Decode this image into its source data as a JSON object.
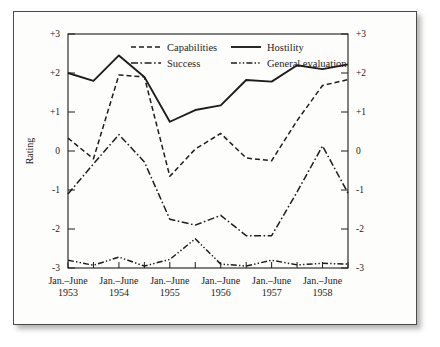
{
  "figure": {
    "background_color": "#fdfdfb",
    "ink_color": "#1d1d1d",
    "border_color": "#4a4a46"
  },
  "chart_data": {
    "type": "line",
    "title": "",
    "xlabel": "",
    "ylabel": "Rating",
    "ylim": [
      -3,
      3
    ],
    "yticks": [
      3,
      2,
      1,
      0,
      -1,
      -2,
      -3
    ],
    "ytick_labels_left": [
      "+3",
      "+2",
      "+1",
      "0",
      "-1",
      "-2",
      "-3"
    ],
    "ytick_labels_right": [
      "+3",
      "+2",
      "+1",
      "0",
      "-1",
      "-2",
      "-3"
    ],
    "grid": false,
    "legend_position": "top-center",
    "x": [
      1,
      2,
      3,
      4,
      5,
      6,
      7,
      8,
      9,
      10,
      11,
      12
    ],
    "categories": [
      "Jan.–June 1953",
      "July–Dec. 1953",
      "Jan.–June 1954",
      "July–Dec. 1954",
      "Jan.–June 1955",
      "July–Dec. 1955",
      "Jan.–June 1956",
      "July–Dec. 1956",
      "Jan.–June 1957",
      "July–Dec. 1957",
      "Jan.–June 1958",
      "July–Dec. 1958"
    ],
    "xtick_labels": [
      {
        "line1": "Jan.–June",
        "line2": "1953"
      },
      {
        "line1": "Jan.–June",
        "line2": "1954"
      },
      {
        "line1": "Jan.–June",
        "line2": "1955"
      },
      {
        "line1": "Jan.–June",
        "line2": "1956"
      },
      {
        "line1": "Jan.–June",
        "line2": "1957"
      },
      {
        "line1": "Jan.–June",
        "line2": "1958"
      }
    ],
    "series": [
      {
        "name": "Capabilities",
        "style": "dashed",
        "values": [
          0.33,
          -0.2,
          1.95,
          1.9,
          -0.65,
          0.05,
          0.45,
          -0.18,
          -0.25,
          0.78,
          1.68,
          1.83
        ]
      },
      {
        "name": "Hostility",
        "style": "solid",
        "values": [
          2.0,
          1.8,
          2.45,
          1.9,
          0.75,
          1.05,
          1.17,
          1.82,
          1.78,
          2.2,
          2.1,
          2.22
        ]
      },
      {
        "name": "Success",
        "style": "dash-dot",
        "values": [
          -1.1,
          -0.33,
          0.42,
          -0.28,
          -1.75,
          -1.9,
          -1.65,
          -2.17,
          -2.17,
          -1.05,
          0.13,
          -1.08
        ]
      },
      {
        "name": "General evaluation",
        "style": "dash-dot-dot",
        "values": [
          -2.8,
          -2.93,
          -2.72,
          -2.95,
          -2.78,
          -2.25,
          -2.9,
          -2.95,
          -2.8,
          -2.92,
          -2.88,
          -2.9
        ]
      }
    ]
  },
  "legend": {
    "entries": [
      {
        "label": "Capabilities",
        "style": "dashed"
      },
      {
        "label": "Hostility",
        "style": "solid"
      },
      {
        "label": "Success",
        "style": "dash-dot"
      },
      {
        "label": "General evaluation",
        "style": "dash-dot-dot"
      }
    ]
  }
}
